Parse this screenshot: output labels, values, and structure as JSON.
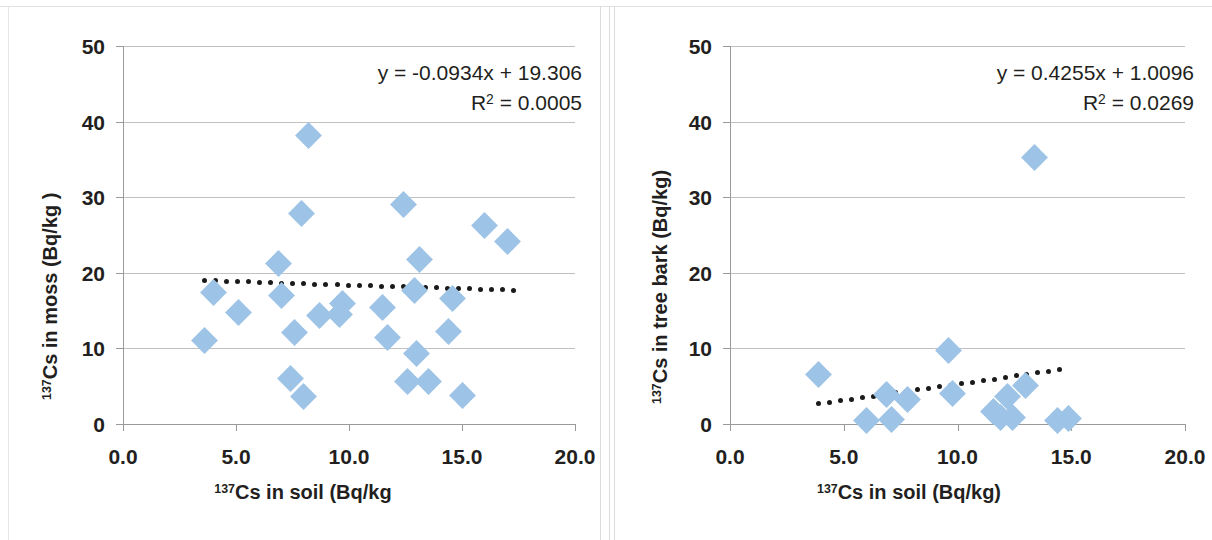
{
  "figure": {
    "marker_color": "#9dc3e6",
    "trendline_color": "#1a1a1a",
    "gridline_color": "#b6b6b6",
    "axis_color": "#9a9a9a",
    "text_color": "#231f20"
  },
  "panels": [
    {
      "id": "moss",
      "equation": "y = -0.0934x + 19.306",
      "r_squared_label": "R",
      "r_squared_exp": "2",
      "r_squared_value": " = 0.0005",
      "x_title_sup": "137",
      "x_title_text": "Cs in soil (Bq/kg",
      "y_title_sup": "137",
      "y_title_text": "Cs in moss (Bq/kg )",
      "x_ticks": [
        "0.0",
        "5.0",
        "10.0",
        "15.0",
        "20.0"
      ],
      "y_ticks": [
        "50",
        "40",
        "30",
        "20",
        "10",
        "0"
      ]
    },
    {
      "id": "bark",
      "equation": "y = 0.4255x + 1.0096",
      "r_squared_label": "R",
      "r_squared_exp": "2",
      "r_squared_value": " = 0.0269",
      "x_title_sup": "137",
      "x_title_text": "Cs in soil (Bq/kg)",
      "y_title_sup": "137",
      "y_title_text": "Cs in tree bark (Bq/kg)",
      "x_ticks": [
        "0.0",
        "5.0",
        "10.0",
        "15.0",
        "20.0"
      ],
      "y_ticks": [
        "50",
        "40",
        "30",
        "20",
        "10",
        "0"
      ]
    }
  ],
  "chart_data": [
    {
      "type": "scatter",
      "title": "",
      "xlabel": "137Cs in soil (Bq/kg",
      "ylabel": "137Cs in moss (Bq/kg )",
      "xlim": [
        0,
        20
      ],
      "ylim": [
        0,
        50
      ],
      "xticks": [
        0,
        5,
        10,
        15,
        20
      ],
      "yticks": [
        0,
        10,
        20,
        30,
        40,
        50
      ],
      "grid": "horizontal",
      "legend": "none",
      "annotations": [
        "y = -0.0934x + 19.306",
        "R² = 0.0005"
      ],
      "trendline": {
        "type": "linear",
        "slope": -0.0934,
        "intercept": 19.306,
        "r_squared": 0.0005,
        "style": "dotted",
        "x_start": 3.6,
        "x_end": 17.3
      },
      "points": [
        {
          "x": 3.6,
          "y": 11.1
        },
        {
          "x": 4.0,
          "y": 17.4
        },
        {
          "x": 5.1,
          "y": 14.7
        },
        {
          "x": 6.9,
          "y": 21.2
        },
        {
          "x": 7.0,
          "y": 17.0
        },
        {
          "x": 7.4,
          "y": 6.0
        },
        {
          "x": 7.6,
          "y": 12.1
        },
        {
          "x": 7.9,
          "y": 27.8
        },
        {
          "x": 8.0,
          "y": 3.7
        },
        {
          "x": 8.2,
          "y": 38.1
        },
        {
          "x": 8.7,
          "y": 14.4
        },
        {
          "x": 9.6,
          "y": 14.5
        },
        {
          "x": 9.7,
          "y": 15.9
        },
        {
          "x": 11.5,
          "y": 15.4
        },
        {
          "x": 11.7,
          "y": 11.5
        },
        {
          "x": 12.4,
          "y": 29.0
        },
        {
          "x": 12.6,
          "y": 5.6
        },
        {
          "x": 12.9,
          "y": 17.7
        },
        {
          "x": 13.0,
          "y": 9.3
        },
        {
          "x": 13.1,
          "y": 21.8
        },
        {
          "x": 13.5,
          "y": 5.6
        },
        {
          "x": 14.4,
          "y": 12.3
        },
        {
          "x": 14.6,
          "y": 16.6
        },
        {
          "x": 15.0,
          "y": 3.8
        },
        {
          "x": 16.0,
          "y": 26.3
        },
        {
          "x": 17.0,
          "y": 24.2
        }
      ]
    },
    {
      "type": "scatter",
      "title": "",
      "xlabel": "137Cs in soil (Bq/kg)",
      "ylabel": "137Cs in tree bark (Bq/kg)",
      "xlim": [
        0,
        20
      ],
      "ylim": [
        0,
        50
      ],
      "xticks": [
        0,
        5,
        10,
        15,
        20
      ],
      "yticks": [
        0,
        10,
        20,
        30,
        40,
        50
      ],
      "grid": "horizontal",
      "legend": "none",
      "annotations": [
        "y = 0.4255x + 1.0096",
        "R² = 0.0269"
      ],
      "trendline": {
        "type": "linear",
        "slope": 0.4255,
        "intercept": 1.0096,
        "r_squared": 0.0269,
        "style": "dotted",
        "x_start": 3.9,
        "x_end": 14.5
      },
      "points": [
        {
          "x": 3.9,
          "y": 6.5
        },
        {
          "x": 6.0,
          "y": 0.5
        },
        {
          "x": 6.9,
          "y": 3.9
        },
        {
          "x": 7.1,
          "y": 0.6
        },
        {
          "x": 7.8,
          "y": 3.2
        },
        {
          "x": 9.6,
          "y": 9.7
        },
        {
          "x": 9.8,
          "y": 4.1
        },
        {
          "x": 11.6,
          "y": 1.6
        },
        {
          "x": 11.9,
          "y": 0.8
        },
        {
          "x": 12.2,
          "y": 3.6
        },
        {
          "x": 12.4,
          "y": 0.9
        },
        {
          "x": 13.0,
          "y": 5.1
        },
        {
          "x": 13.4,
          "y": 35.2
        },
        {
          "x": 14.4,
          "y": 0.5
        },
        {
          "x": 14.9,
          "y": 0.7
        }
      ]
    }
  ]
}
